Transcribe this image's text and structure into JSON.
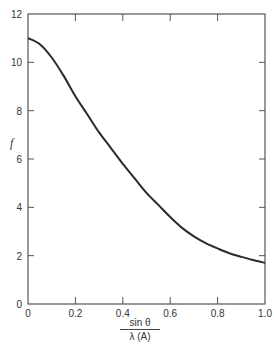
{
  "chart_data": {
    "type": "line",
    "title": "",
    "xlabel": "sin θ / λ (Å)",
    "xlabel_numerator": "sin θ",
    "xlabel_denominator": "λ (A)",
    "ylabel": "f",
    "xlim": [
      0,
      1.0
    ],
    "ylim": [
      0,
      12
    ],
    "x_ticks": [
      "0",
      "0.2",
      "0.4",
      "0.6",
      "0.8",
      "1.0"
    ],
    "y_ticks": [
      "0",
      "2",
      "4",
      "6",
      "8",
      "10",
      "12"
    ],
    "grid": false,
    "legend": null,
    "series": [
      {
        "name": "f",
        "color": "#2a2a2a",
        "x": [
          0,
          0.05,
          0.1,
          0.15,
          0.2,
          0.25,
          0.3,
          0.35,
          0.4,
          0.45,
          0.5,
          0.55,
          0.6,
          0.65,
          0.7,
          0.75,
          0.8,
          0.85,
          0.9,
          0.95,
          1.0
        ],
        "values": [
          11.0,
          10.75,
          10.2,
          9.45,
          8.6,
          7.85,
          7.1,
          6.45,
          5.8,
          5.2,
          4.6,
          4.1,
          3.6,
          3.15,
          2.8,
          2.52,
          2.3,
          2.1,
          1.95,
          1.82,
          1.7
        ]
      }
    ]
  }
}
